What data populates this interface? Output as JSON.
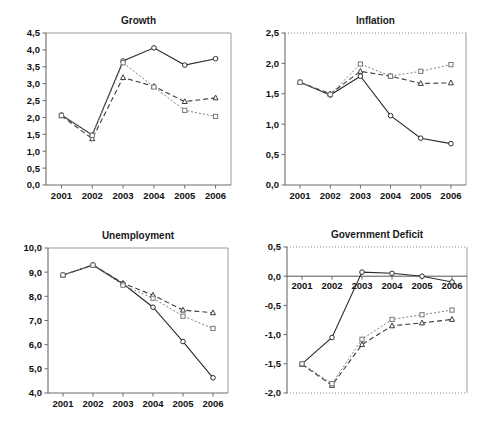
{
  "figure": {
    "panel_count": 4,
    "background": "#ffffff"
  },
  "chart_data": [
    {
      "type": "line",
      "title": "Growth",
      "xlabel": "",
      "ylabel": "",
      "x": [
        "2001",
        "2002",
        "2003",
        "2004",
        "2005",
        "2006"
      ],
      "categories": [
        "2001",
        "2002",
        "2003",
        "2004",
        "2005",
        "2006"
      ],
      "ylim": [
        0.0,
        4.5
      ],
      "yticks": [
        "0,0",
        "0,5",
        "1,0",
        "1,5",
        "2,0",
        "2,5",
        "3,0",
        "3,5",
        "4,0",
        "4,5"
      ],
      "ytick_values": [
        0.0,
        0.5,
        1.0,
        1.5,
        2.0,
        2.5,
        3.0,
        3.5,
        4.0,
        4.5
      ],
      "grid": false,
      "legend": "none",
      "series": [
        {
          "name": "solid-circle",
          "marker": "circle",
          "line": "solid",
          "color": "#2b2b2b",
          "values": [
            2.07,
            1.48,
            3.67,
            4.06,
            3.55,
            3.74
          ]
        },
        {
          "name": "dashed-triangle",
          "marker": "triangle",
          "line": "dashed",
          "color": "#3a3a3a",
          "values": [
            2.05,
            1.37,
            3.18,
            2.92,
            2.47,
            2.58
          ]
        },
        {
          "name": "dotted-square",
          "marker": "square",
          "line": "dotted",
          "color": "#808080",
          "values": [
            2.06,
            1.47,
            3.62,
            2.9,
            2.21,
            2.03
          ]
        }
      ]
    },
    {
      "type": "line",
      "title": "Inflation",
      "xlabel": "",
      "ylabel": "",
      "x": [
        "2001",
        "2002",
        "2003",
        "2004",
        "2005",
        "2006"
      ],
      "categories": [
        "2001",
        "2002",
        "2003",
        "2004",
        "2005",
        "2006"
      ],
      "ylim": [
        0.0,
        2.5
      ],
      "yticks": [
        "0,0",
        "0,5",
        "1,0",
        "1,5",
        "2,0",
        "2,5"
      ],
      "ytick_values": [
        0.0,
        0.5,
        1.0,
        1.5,
        2.0,
        2.5
      ],
      "grid": false,
      "legend": "none",
      "series": [
        {
          "name": "solid-circle",
          "marker": "circle",
          "line": "solid",
          "color": "#2b2b2b",
          "values": [
            1.69,
            1.48,
            1.79,
            1.14,
            0.77,
            0.68
          ]
        },
        {
          "name": "dashed-triangle",
          "marker": "triangle",
          "line": "dashed",
          "color": "#3a3a3a",
          "values": [
            1.69,
            1.5,
            1.87,
            1.79,
            1.67,
            1.68
          ]
        },
        {
          "name": "dotted-square",
          "marker": "square",
          "line": "dotted",
          "color": "#808080",
          "values": [
            1.69,
            1.49,
            1.99,
            1.79,
            1.87,
            1.98
          ]
        }
      ]
    },
    {
      "type": "line",
      "title": "Unemployment",
      "xlabel": "",
      "ylabel": "",
      "x": [
        "2001",
        "2002",
        "2003",
        "2004",
        "2005",
        "2006"
      ],
      "categories": [
        "2001",
        "2002",
        "2003",
        "2004",
        "2005",
        "2006"
      ],
      "ylim": [
        4.0,
        10.0
      ],
      "yticks": [
        "4,0",
        "5,0",
        "6,0",
        "7,0",
        "8,0",
        "9,0",
        "10,0"
      ],
      "ytick_values": [
        4.0,
        5.0,
        6.0,
        7.0,
        8.0,
        9.0,
        10.0
      ],
      "grid": false,
      "legend": "none",
      "series": [
        {
          "name": "solid-circle",
          "marker": "circle",
          "line": "solid",
          "color": "#2b2b2b",
          "values": [
            8.88,
            9.29,
            8.52,
            7.55,
            6.13,
            4.63
          ]
        },
        {
          "name": "dashed-triangle",
          "marker": "triangle",
          "line": "dashed",
          "color": "#3a3a3a",
          "values": [
            8.88,
            9.3,
            8.54,
            8.05,
            7.43,
            7.32
          ]
        },
        {
          "name": "dotted-square",
          "marker": "square",
          "line": "dotted",
          "color": "#808080",
          "values": [
            8.88,
            9.29,
            8.46,
            7.92,
            7.18,
            6.67
          ]
        }
      ]
    },
    {
      "type": "line",
      "title": "Government Deficit",
      "xlabel": "",
      "ylabel": "",
      "x": [
        "2001",
        "2002",
        "2003",
        "2004",
        "2005",
        "2006"
      ],
      "categories": [
        "2001",
        "2002",
        "2003",
        "2004",
        "2005",
        "2006"
      ],
      "ylim": [
        -2.0,
        0.5
      ],
      "yticks": [
        "-2,0",
        "-1,5",
        "-1,0",
        "-0,5",
        "0,0",
        "0,5"
      ],
      "ytick_values": [
        -2.0,
        -1.5,
        -1.0,
        -0.5,
        0.0,
        0.5
      ],
      "grid": false,
      "legend": "none",
      "zero_line": 0.0,
      "series": [
        {
          "name": "solid-circle",
          "marker": "circle",
          "line": "solid",
          "color": "#2b2b2b",
          "values": [
            -1.5,
            -1.05,
            0.07,
            0.05,
            0.0,
            -0.1
          ]
        },
        {
          "name": "dashed-triangle",
          "marker": "triangle",
          "line": "dashed",
          "color": "#3a3a3a",
          "values": [
            -1.51,
            -1.87,
            -1.17,
            -0.85,
            -0.8,
            -0.74
          ]
        },
        {
          "name": "dotted-square",
          "marker": "square",
          "line": "dotted",
          "color": "#808080",
          "values": [
            -1.5,
            -1.84,
            -1.08,
            -0.74,
            -0.66,
            -0.58
          ]
        }
      ]
    }
  ]
}
